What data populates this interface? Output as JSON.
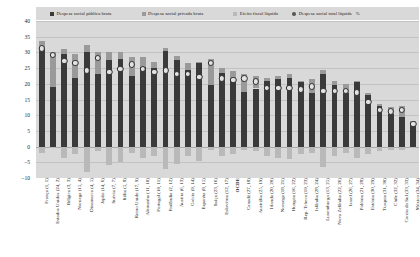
{
  "legend": {
    "items": [
      {
        "label": "Despesa social pública bruta",
        "color": "#3a3a3a",
        "marker": "square"
      },
      {
        "label": "Despesa social privada bruta",
        "color": "#9a9a9a",
        "marker": "square"
      },
      {
        "label": "Efeito fiscal líquido",
        "color": "#b9b9b9",
        "marker": "square"
      },
      {
        "label": "Despesa social total líquida",
        "color": "#555555",
        "marker": "circle"
      }
    ],
    "unit": "%"
  },
  "chart_data": {
    "type": "bar",
    "title": "",
    "subtitle": "",
    "xlabel": "",
    "ylabel": "%",
    "ylim": [
      -10,
      40
    ],
    "yticks": [
      40,
      35,
      30,
      25,
      20,
      15,
      10,
      5,
      0,
      -5,
      -10
    ],
    "grid": true,
    "legend_position": "top",
    "stacked": true,
    "categories": [
      "França (1, 1)",
      "Estados Unidos (24, 2)",
      "Bélgica (3, 3)",
      "Noruega (15, 4)",
      "Dinamarca (4, 5)",
      "Japão (14, 6)",
      "Suécia (7, 7)",
      "Itália (5, 8)",
      "Reino Unido (17, 9)",
      "Alemanha (11, 10)",
      "Portugal (10, 11)",
      "Finlândia (2, 12)",
      "Áustria (6, 13)",
      "Grécia (9, 14)",
      "Espanha (8, 15)",
      "Suíça (23, 16)",
      "Eslovénia (12, 17)",
      "OCDE",
      "Canadá (27, 18)",
      "Austrália (25, 19)",
      "Irlanda (20, 20)",
      "Noruega (18, 21)",
      "Hungria (16, 22)",
      "Rep. Tcheca (19, 23)",
      "Islândia (28, 24)",
      "Luxemburgo (13, 25)",
      "Nova Zelândia (22, 26)",
      "Israel (26, 27)",
      "Polónia (21, 28)",
      "Estónia (30, 29)",
      "Turquia (31, 30)",
      "Chile (32, 32)",
      "Coreia do Sul (33, 33)",
      "México (34, 34)"
    ],
    "series": [
      {
        "name": "Despesa social pública bruta",
        "color": "#3a3a3a",
        "values": [
          31.0,
          19.0,
          29.5,
          22.0,
          30.0,
          23.0,
          27.5,
          28.0,
          22.5,
          25.5,
          25.0,
          30.5,
          27.5,
          24.5,
          26.5,
          19.5,
          23.5,
          21.5,
          17.5,
          18.5,
          21.0,
          21.5,
          22.0,
          20.5,
          17.0,
          23.0,
          19.5,
          17.0,
          20.5,
          16.5,
          13.0,
          10.5,
          9.5,
          7.5
        ]
      },
      {
        "name": "Despesa social privada bruta",
        "color": "#9a9a9a",
        "values": [
          2.5,
          11.0,
          1.5,
          7.5,
          2.5,
          7.0,
          2.5,
          2.0,
          6.0,
          3.0,
          2.0,
          1.0,
          1.5,
          2.0,
          0.5,
          8.5,
          1.5,
          2.5,
          5.5,
          4.0,
          1.0,
          1.0,
          1.0,
          0.5,
          4.5,
          1.5,
          1.5,
          3.0,
          0.5,
          0.5,
          0.5,
          2.0,
          3.5,
          0.5
        ]
      },
      {
        "name": "Efeito fiscal líquido",
        "color": "#b9b9b9",
        "values": [
          -2.0,
          -0.5,
          -3.5,
          -2.5,
          -8.0,
          -1.5,
          -6.0,
          -5.0,
          -2.0,
          -3.5,
          -3.0,
          -7.0,
          -5.5,
          -3.0,
          -4.5,
          -1.0,
          -3.0,
          -2.5,
          -1.0,
          -1.5,
          -3.0,
          -3.5,
          -4.0,
          -2.5,
          -2.0,
          -6.5,
          -3.0,
          -2.0,
          -3.5,
          -2.5,
          -1.5,
          -1.0,
          -1.0,
          -0.5
        ]
      }
    ],
    "net_total": {
      "name": "Despesa social total líquida",
      "values": [
        31.5,
        29.5,
        27.5,
        27.0,
        24.5,
        28.5,
        24.0,
        25.0,
        26.5,
        25.0,
        24.0,
        24.5,
        23.5,
        23.5,
        22.5,
        27.0,
        22.0,
        21.5,
        22.0,
        21.0,
        19.0,
        19.0,
        19.0,
        18.5,
        19.5,
        18.0,
        18.0,
        18.0,
        17.5,
        14.5,
        12.0,
        11.5,
        12.0,
        7.5
      ]
    }
  }
}
